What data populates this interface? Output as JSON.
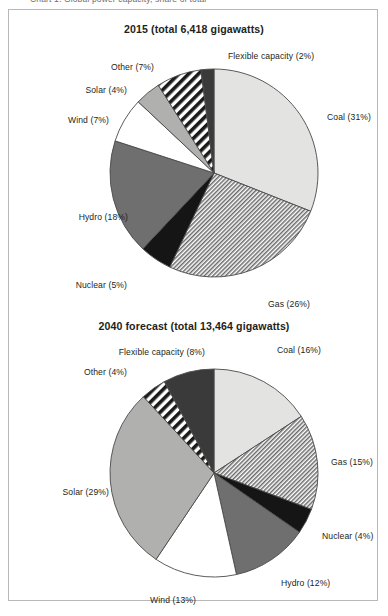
{
  "page": {
    "cut_off_caption": "Chart 1. Global power capacity, share of total",
    "border_color": "#b8b8b8",
    "background": "#ffffff",
    "text_color": "#231f20"
  },
  "palette": {
    "coal": "#e3e3e1",
    "gas": "#c9c9c7",
    "nuclear": "#151515",
    "hydro": "#6f6f6f",
    "wind": "#ffffff",
    "solar": "#b0b0ae",
    "other": "#1a1a1a",
    "flexible": "#3a3a3a",
    "stroke": "#4a4a4a"
  },
  "charts": [
    {
      "id": "chart-1",
      "title": "2015 (total 6,418 gigawatts)",
      "chart_data": {
        "type": "pie",
        "title": "2015 (total 6,418 gigawatts)",
        "total": 6418,
        "total_label": "6,418",
        "unit": "gigawatts",
        "year": "2015",
        "legend": "none",
        "labels_position": "outside",
        "start_angle_deg": 0,
        "direction": "clockwise",
        "categories": [
          "Coal",
          "Gas",
          "Nuclear",
          "Hydro",
          "Wind",
          "Solar",
          "Other",
          "Flexible capacity"
        ],
        "values": [
          31,
          26,
          5,
          18,
          7,
          4,
          7,
          2
        ],
        "unit_of_values": "percent",
        "slices": [
          {
            "name": "Coal",
            "value": 31,
            "label": "Coal (31%)",
            "fill": "#e3e3e1",
            "pattern": "solid",
            "label_side": "right",
            "label_x": 318,
            "label_y": 103
          },
          {
            "name": "Gas",
            "value": 26,
            "label": "Gas (26%)",
            "fill": "#c9c9c7",
            "pattern": "diagonal-fine",
            "label_side": "right",
            "label_x": 259,
            "label_y": 290
          },
          {
            "name": "Nuclear",
            "value": 5,
            "label": "Nuclear (5%)",
            "fill": "#151515",
            "pattern": "solid",
            "label_side": "left",
            "label_x": 118,
            "label_y": 271
          },
          {
            "name": "Hydro",
            "value": 18,
            "label": "Hydro (18%)",
            "fill": "#6f6f6f",
            "pattern": "solid",
            "label_side": "left",
            "label_x": 119,
            "label_y": 203
          },
          {
            "name": "Wind",
            "value": 7,
            "label": "Wind (7%)",
            "fill": "#ffffff",
            "pattern": "solid",
            "label_side": "left",
            "label_x": 100,
            "label_y": 106
          },
          {
            "name": "Solar",
            "value": 4,
            "label": "Solar (4%)",
            "fill": "#b0b0ae",
            "pattern": "solid",
            "label_side": "left",
            "label_x": 118,
            "label_y": 76
          },
          {
            "name": "Other",
            "value": 7,
            "label": "Other (7%)",
            "fill": "#1a1a1a",
            "pattern": "diagonal-bold",
            "label_side": "left",
            "label_x": 145,
            "label_y": 53
          },
          {
            "name": "Flexible capacity",
            "value": 2,
            "label": "Flexible capacity (2%)",
            "fill": "#3a3a3a",
            "pattern": "solid",
            "label_side": "right",
            "label_x": 219,
            "label_y": 42
          }
        ]
      }
    },
    {
      "id": "chart-2",
      "title": "2040 forecast (total 13,464 gigawatts)",
      "chart_data": {
        "type": "pie",
        "title": "2040 forecast (total 13,464 gigawatts)",
        "total": 13464,
        "total_label": "13,464",
        "unit": "gigawatts",
        "year": "2040 forecast",
        "legend": "none",
        "labels_position": "outside",
        "start_angle_deg": 0,
        "direction": "clockwise",
        "categories": [
          "Coal",
          "Gas",
          "Nuclear",
          "Hydro",
          "Wind",
          "Solar",
          "Other",
          "Flexible capacity"
        ],
        "values": [
          16,
          15,
          4,
          12,
          13,
          29,
          4,
          8
        ],
        "unit_of_values": "percent",
        "slices": [
          {
            "name": "Coal",
            "value": 16,
            "label": "Coal (16%)",
            "fill": "#e3e3e1",
            "pattern": "solid",
            "label_side": "right",
            "label_x": 268,
            "label_y": 38
          },
          {
            "name": "Gas",
            "value": 15,
            "label": "Gas (15%)",
            "fill": "#c9c9c7",
            "pattern": "diagonal-fine",
            "label_side": "right",
            "label_x": 322,
            "label_y": 150
          },
          {
            "name": "Nuclear",
            "value": 4,
            "label": "Nuclear (4%)",
            "fill": "#151515",
            "pattern": "solid",
            "label_side": "right",
            "label_x": 313,
            "label_y": 224
          },
          {
            "name": "Hydro",
            "value": 12,
            "label": "Hydro (12%)",
            "fill": "#6f6f6f",
            "pattern": "solid",
            "label_side": "right",
            "label_x": 272,
            "label_y": 271
          },
          {
            "name": "Wind",
            "value": 13,
            "label": "Wind (13%)",
            "fill": "#ffffff",
            "pattern": "solid",
            "label_side": "left",
            "label_x": 187,
            "label_y": 288
          },
          {
            "name": "Solar",
            "value": 29,
            "label": "Solar (29%)",
            "fill": "#b0b0ae",
            "pattern": "solid",
            "label_side": "left",
            "label_x": 100,
            "label_y": 180
          },
          {
            "name": "Other",
            "value": 4,
            "label": "Other (4%)",
            "fill": "#1a1a1a",
            "pattern": "diagonal-bold",
            "label_side": "left",
            "label_x": 118,
            "label_y": 60
          },
          {
            "name": "Flexible capacity",
            "value": 8,
            "label": "Flexible capacity (8%)",
            "fill": "#3a3a3a",
            "pattern": "solid",
            "label_side": "left",
            "label_x": 196,
            "label_y": 40
          }
        ]
      }
    }
  ]
}
